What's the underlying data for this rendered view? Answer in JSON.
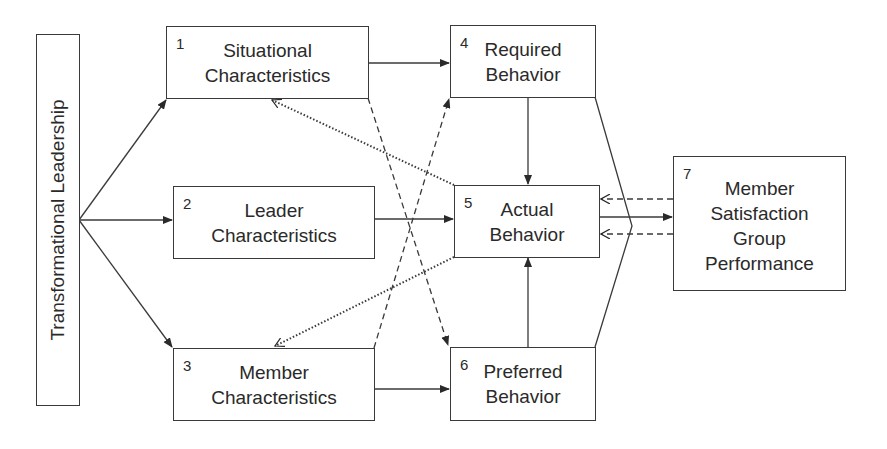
{
  "diagram": {
    "source_box": {
      "label": "Transformational Leadership"
    },
    "boxes": [
      {
        "id": 1,
        "num": "1",
        "lines": [
          "Situational",
          "Characteristics"
        ]
      },
      {
        "id": 2,
        "num": "2",
        "lines": [
          "Leader",
          "Characteristics"
        ]
      },
      {
        "id": 3,
        "num": "3",
        "lines": [
          "Member",
          "Characteristics"
        ]
      },
      {
        "id": 4,
        "num": "4",
        "lines": [
          "Required",
          "Behavior"
        ]
      },
      {
        "id": 5,
        "num": "5",
        "lines": [
          "Actual",
          "Behavior"
        ]
      },
      {
        "id": 6,
        "num": "6",
        "lines": [
          "Preferred",
          "Behavior"
        ]
      },
      {
        "id": 7,
        "num": "7",
        "lines": [
          "Member",
          "Satisfaction",
          "Group",
          "Performance"
        ]
      }
    ],
    "edges": [
      {
        "from": "Transformational Leadership",
        "to": "1",
        "style": "solid"
      },
      {
        "from": "Transformational Leadership",
        "to": "2",
        "style": "solid"
      },
      {
        "from": "Transformational Leadership",
        "to": "3",
        "style": "solid"
      },
      {
        "from": "1",
        "to": "4",
        "style": "solid"
      },
      {
        "from": "2",
        "to": "5",
        "style": "solid"
      },
      {
        "from": "3",
        "to": "6",
        "style": "solid"
      },
      {
        "from": "4",
        "to": "5",
        "style": "solid"
      },
      {
        "from": "6",
        "to": "5",
        "style": "solid"
      },
      {
        "from": "1",
        "to": "6",
        "style": "dashed"
      },
      {
        "from": "3",
        "to": "4",
        "style": "dashed"
      },
      {
        "from": "5",
        "to": "1",
        "style": "dotted"
      },
      {
        "from": "5",
        "to": "3",
        "style": "dotted"
      },
      {
        "from": "4/5/6 (congruence)",
        "to": "7",
        "style": "solid"
      },
      {
        "from": "7",
        "to": "5",
        "style": "dashed",
        "count": 2
      }
    ],
    "colors": {
      "line": "#3a3a3a",
      "background": "#ffffff"
    }
  }
}
